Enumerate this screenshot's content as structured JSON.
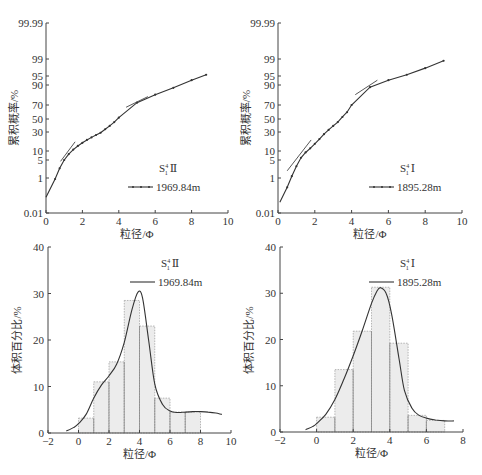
{
  "chart_data": [
    {
      "id": "top-left",
      "type": "line",
      "subtype": "probability-cumulative",
      "title": "",
      "sample_label": "S₁⁴ Ⅱ",
      "legend": [
        {
          "name": "1969.84m",
          "marker": "dot-line"
        }
      ],
      "xlabel": "粒径/Φ",
      "ylabel": "累积概率/%",
      "xlim": [
        0,
        10
      ],
      "xticks": [
        0,
        2,
        4,
        6,
        8,
        10
      ],
      "yticks": [
        "0.01",
        "1",
        "5",
        "10",
        "30",
        "50",
        "70",
        "90",
        "95",
        "99",
        "99.99"
      ],
      "series": [
        {
          "name": "1969.84m",
          "x": [
            0,
            0.5,
            0.75,
            1.0,
            1.25,
            1.5,
            1.75,
            2.0,
            2.25,
            2.5,
            2.75,
            3.0,
            3.25,
            3.5,
            3.75,
            4.0,
            5.0,
            6.0,
            7.0,
            8.0,
            8.8
          ],
          "y": [
            0.1,
            0.9,
            2.5,
            5,
            8,
            11,
            14,
            17,
            20,
            23,
            26,
            29,
            34,
            39,
            45,
            52,
            73,
            82,
            88,
            93,
            95.5
          ]
        }
      ],
      "segment_lines": [
        {
          "x": [
            0.8,
            1.6
          ],
          "y": [
            4.5,
            18
          ]
        },
        {
          "x": [
            4.4,
            5.6
          ],
          "y": [
            67,
            80
          ]
        }
      ]
    },
    {
      "id": "top-right",
      "type": "line",
      "subtype": "probability-cumulative",
      "title": "",
      "sample_label": "S₁⁴ Ⅰ",
      "legend": [
        {
          "name": "1895.28m",
          "marker": "dot-line"
        }
      ],
      "xlabel": "粒径/Φ",
      "ylabel": "累积概率/%",
      "xlim": [
        0,
        10
      ],
      "xticks": [
        0,
        2,
        4,
        6,
        8,
        10
      ],
      "yticks": [
        "0.01",
        "1",
        "5",
        "10",
        "30",
        "50",
        "70",
        "90",
        "95",
        "99",
        "99.99"
      ],
      "series": [
        {
          "name": "1895.28m",
          "x": [
            0.1,
            0.5,
            0.75,
            1.0,
            1.25,
            1.5,
            1.75,
            2.0,
            2.25,
            2.5,
            2.75,
            3.0,
            3.25,
            3.5,
            3.75,
            4.0,
            5.0,
            6.0,
            7.0,
            8.0,
            9.0
          ],
          "y": [
            0.05,
            0.35,
            1.2,
            3,
            6,
            9,
            12,
            16,
            21,
            27,
            33,
            39,
            45,
            53,
            60,
            70,
            88.5,
            93,
            95.5,
            97.5,
            98.8
          ]
        }
      ],
      "segment_lines": [
        {
          "x": [
            0.5,
            1.8
          ],
          "y": [
            2,
            20
          ]
        },
        {
          "x": [
            4.2,
            5.4
          ],
          "y": [
            82,
            93
          ]
        }
      ]
    },
    {
      "id": "bottom-left",
      "type": "bar",
      "subtype": "histogram-with-density",
      "title": "",
      "sample_label": "S₁⁴ Ⅱ",
      "legend": [
        {
          "name": "1969.84m",
          "marker": "line"
        }
      ],
      "xlabel": "粒径/Φ",
      "ylabel": "体积百分比/%",
      "xlim": [
        -2,
        10
      ],
      "ylim": [
        0,
        40
      ],
      "xticks": [
        -2,
        0,
        2,
        4,
        6,
        8,
        10
      ],
      "yticks": [
        0,
        10,
        20,
        30,
        40
      ],
      "bins": [
        [
          0,
          1
        ],
        [
          1,
          2
        ],
        [
          2,
          3
        ],
        [
          3,
          4
        ],
        [
          4,
          5
        ],
        [
          5,
          6
        ],
        [
          6,
          7
        ],
        [
          7,
          8
        ]
      ],
      "values": [
        3.2,
        11.0,
        15.3,
        28.5,
        23.0,
        7.5,
        4.5,
        4.5
      ],
      "density_curve": {
        "x": [
          -0.8,
          -0.3,
          0,
          0.5,
          1.0,
          1.5,
          2.0,
          2.5,
          3.0,
          3.5,
          3.9,
          4.2,
          4.6,
          5.0,
          5.5,
          6.0,
          6.5,
          7.0,
          7.5,
          8.0,
          8.5,
          9.0,
          9.4
        ],
        "y": [
          0.4,
          1.2,
          2.0,
          4.0,
          7.5,
          10.3,
          12.3,
          14.8,
          19.5,
          26.5,
          30.3,
          29.0,
          20.0,
          10.5,
          6.2,
          4.7,
          4.4,
          4.5,
          4.6,
          4.6,
          4.5,
          4.3,
          4.0
        ]
      }
    },
    {
      "id": "bottom-right",
      "type": "bar",
      "subtype": "histogram-with-density",
      "title": "",
      "sample_label": "S₁⁴ Ⅰ",
      "legend": [
        {
          "name": "1895.28m",
          "marker": "line"
        }
      ],
      "xlabel": "粒径/Φ",
      "ylabel": "体积百分比/%",
      "xlim": [
        -2,
        8
      ],
      "ylim": [
        0,
        40
      ],
      "xticks": [
        -2,
        0,
        2,
        4,
        6,
        8
      ],
      "yticks": [
        0,
        10,
        20,
        30,
        40
      ],
      "bins": [
        [
          0,
          1
        ],
        [
          1,
          2
        ],
        [
          2,
          3
        ],
        [
          3,
          4
        ],
        [
          4,
          5
        ],
        [
          5,
          6
        ],
        [
          6,
          7
        ]
      ],
      "values": [
        3.2,
        13.5,
        21.8,
        31.3,
        19.2,
        3.6,
        2.5
      ],
      "density_curve": {
        "x": [
          -0.6,
          -0.2,
          0,
          0.5,
          1.0,
          1.5,
          2.0,
          2.5,
          3.0,
          3.3,
          3.5,
          3.8,
          4.1,
          4.5,
          4.8,
          5.2,
          5.6,
          6.0,
          6.5,
          7.0,
          7.5
        ],
        "y": [
          0.5,
          1.2,
          1.8,
          3.8,
          7.0,
          11.5,
          16.5,
          22.0,
          27.8,
          30.5,
          31.2,
          30.0,
          25.5,
          16.0,
          9.0,
          5.2,
          3.6,
          3.0,
          2.6,
          2.4,
          2.4
        ]
      }
    }
  ],
  "layout_px": {
    "top-left": {
      "x0": 46,
      "x1": 228,
      "y_axis_bottom": 213,
      "y_axis_top": 23
    },
    "top-right": {
      "x0": 278,
      "x1": 462,
      "y_axis_bottom": 213,
      "y_axis_top": 23
    },
    "bottom-left": {
      "x0": 48,
      "x1": 231,
      "y0": 433,
      "y1": 247
    },
    "bottom-right": {
      "x0": 280,
      "x1": 463,
      "y0": 432,
      "y1": 247
    }
  },
  "prob_ytick_px": {
    "0.01": 213,
    "1": 178,
    "5": 160,
    "10": 151,
    "30": 132,
    "50": 119,
    "70": 105,
    "90": 85,
    "95": 76,
    "99": 59,
    "99.99": 23
  }
}
